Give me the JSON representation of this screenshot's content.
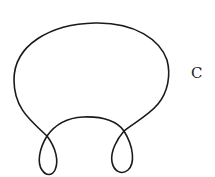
{
  "diagram": {
    "type": "closed-curve-with-two-loops",
    "label": "C",
    "colors": {
      "stroke": "#1a1a1a",
      "background": "#ffffff",
      "label": "#222222"
    }
  }
}
